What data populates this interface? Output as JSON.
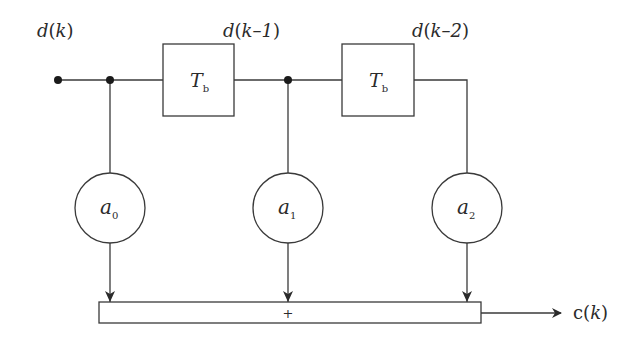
{
  "diagram": {
    "type": "transversal-filter-block-diagram",
    "input_label": {
      "var": "d",
      "arg": "k"
    },
    "delay_taps": [
      {
        "label": {
          "var": "d",
          "arg": "k–1"
        }
      },
      {
        "label": {
          "var": "d",
          "arg": "k–2"
        }
      }
    ],
    "delay_blocks": [
      {
        "symbol": "T",
        "subscript": "b"
      },
      {
        "symbol": "T",
        "subscript": "b"
      }
    ],
    "coefficients": [
      {
        "symbol": "a",
        "subscript": "0"
      },
      {
        "symbol": "a",
        "subscript": "1"
      },
      {
        "symbol": "a",
        "subscript": "2"
      }
    ],
    "summer": {
      "symbol": "+"
    },
    "output_label": {
      "var": "c",
      "arg": "k"
    },
    "colors": {
      "stroke": "#3a3a3a",
      "text": "#2b2b2b",
      "background": "#ffffff"
    }
  }
}
